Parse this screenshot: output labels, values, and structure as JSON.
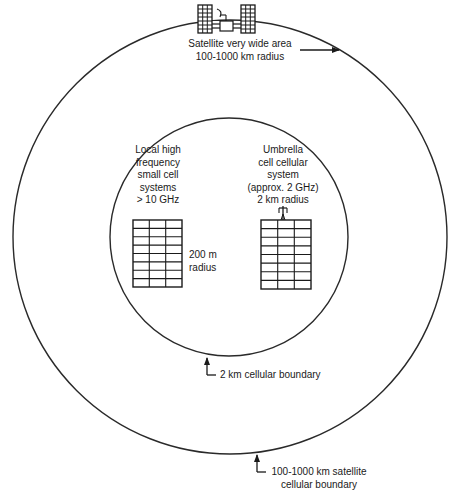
{
  "diagram": {
    "type": "nested coverage cells",
    "colors": {
      "line": "#2a2a2a",
      "background": "#ffffff"
    },
    "outer_circle": {
      "cx": 230,
      "cy": 237,
      "r": 217,
      "label": "100-1000 km satellite cellular boundary"
    },
    "inner_circle": {
      "cx": 229,
      "cy": 237,
      "r": 119,
      "label": "2 km cellular boundary"
    }
  },
  "labels": {
    "satellite": {
      "line1": "Satellite very wide area",
      "line2": "100-1000 km radius"
    },
    "local": {
      "line1": "Local high",
      "line2": "frequency",
      "line3": "small cell",
      "line4": "systems",
      "line5": "> 10 GHz"
    },
    "local_radius": {
      "line1": "200 m",
      "line2": "radius"
    },
    "umbrella": {
      "line1": "Umbrella",
      "line2": "cell cellular",
      "line3": "system",
      "line4": "(approx. 2 GHz)",
      "line5": "2 km radius"
    },
    "inner_boundary": {
      "text": "2 km cellular boundary"
    },
    "outer_boundary": {
      "line1": "100-1000 km satellite",
      "line2": "cellular boundary"
    }
  },
  "icons": {
    "satellite": "satellite-icon",
    "building_left": "building-icon",
    "building_right": "building-with-antenna-icon"
  }
}
